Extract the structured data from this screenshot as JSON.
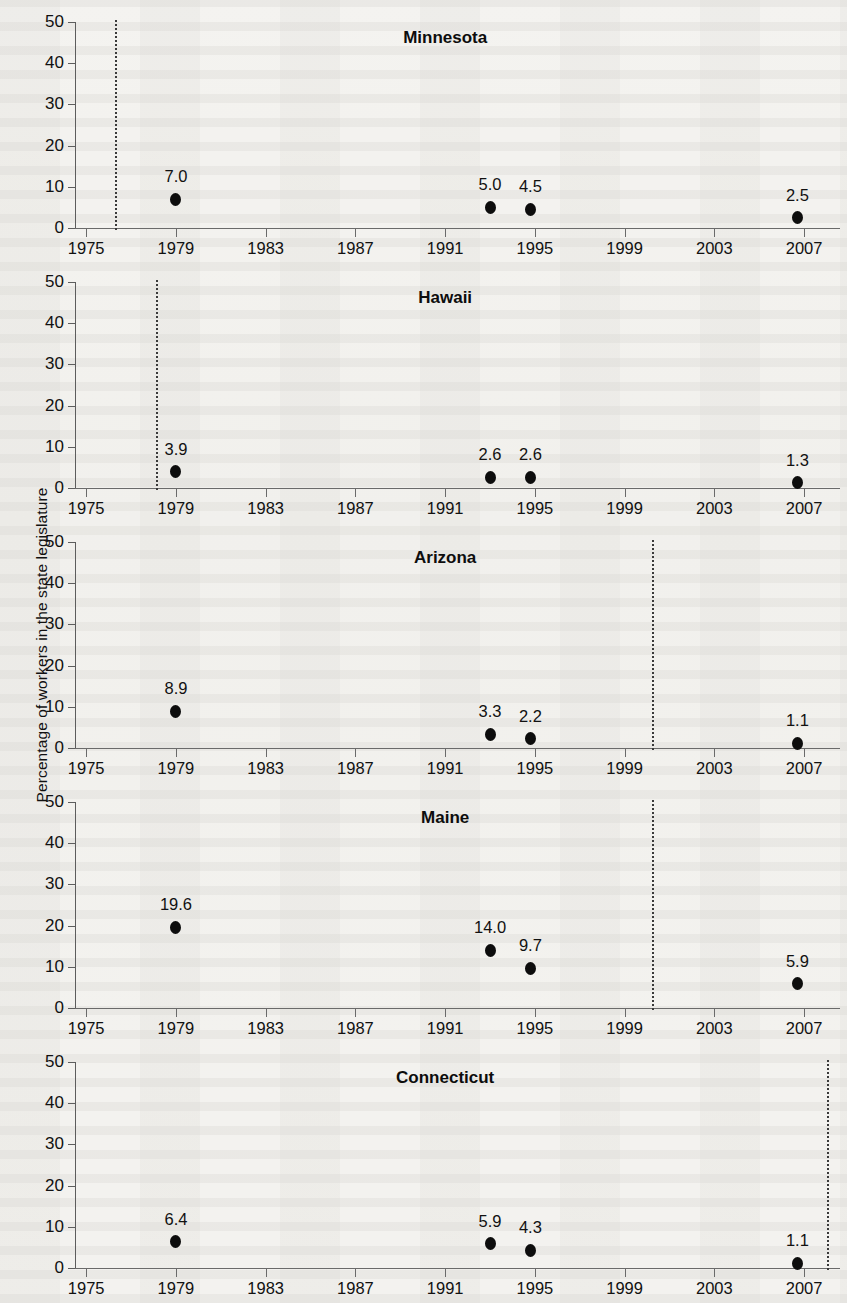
{
  "figure": {
    "ylabel": "Percentage of workers in the state legislature"
  },
  "chart_data": {
    "type": "scatter",
    "title": "",
    "subtitle": "",
    "xlabel": "",
    "ylabel": "Percentage of workers in the state legislature",
    "xlim": [
      1974.5,
      2008.6
    ],
    "ylim": [
      0,
      50
    ],
    "yticks": [
      0,
      10,
      20,
      30,
      40,
      50
    ],
    "ytick_labels": [
      "0",
      "10",
      "20",
      "30",
      "40",
      "50"
    ],
    "xticks": [
      1975,
      1979,
      1983,
      1987,
      1991,
      1995,
      1999,
      2003,
      2007
    ],
    "xtick_labels": [
      "1975",
      "1979",
      "1983",
      "1987",
      "1991",
      "1995",
      "1999",
      "2003",
      "2007"
    ],
    "grid": false,
    "legend": null,
    "annotations": "Dotted vertical line in each panel marks a state-specific reference year.",
    "panels": [
      {
        "name": "Minnesota",
        "title": "Minnesota",
        "title_x": 1991.0,
        "refline_year": 1976.3,
        "x": [
          1979.0,
          1993.0,
          1994.8,
          2006.7
        ],
        "y": [
          7.0,
          5.0,
          4.5,
          2.5
        ],
        "labels": [
          "7.0",
          "5.0",
          "4.5",
          "2.5"
        ]
      },
      {
        "name": "Hawaii",
        "title": "Hawaii",
        "title_x": 1991.0,
        "refline_year": 1978.1,
        "x": [
          1979.0,
          1993.0,
          1994.8,
          2006.7
        ],
        "y": [
          3.9,
          2.6,
          2.6,
          1.3
        ],
        "labels": [
          "3.9",
          "2.6",
          "2.6",
          "1.3"
        ]
      },
      {
        "name": "Arizona",
        "title": "Arizona",
        "title_x": 1991.0,
        "refline_year": 2000.2,
        "x": [
          1979.0,
          1993.0,
          1994.8,
          2006.7
        ],
        "y": [
          8.9,
          3.3,
          2.2,
          1.1
        ],
        "labels": [
          "8.9",
          "3.3",
          "2.2",
          "1.1"
        ]
      },
      {
        "name": "Maine",
        "title": "Maine",
        "title_x": 1991.0,
        "refline_year": 2000.2,
        "x": [
          1979.0,
          1993.0,
          1994.8,
          2006.7
        ],
        "y": [
          19.6,
          14.0,
          9.7,
          5.9
        ],
        "labels": [
          "19.6",
          "14.0",
          "9.7",
          "5.9"
        ]
      },
      {
        "name": "Connecticut",
        "title": "Connecticut",
        "title_x": 1991.0,
        "refline_year": 2008.0,
        "x": [
          1979.0,
          1993.0,
          1994.8,
          2006.7
        ],
        "y": [
          6.4,
          5.9,
          4.3,
          1.1
        ],
        "labels": [
          "6.4",
          "5.9",
          "4.3",
          "1.1"
        ]
      }
    ]
  }
}
